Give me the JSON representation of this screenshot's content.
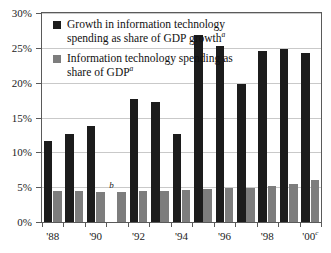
{
  "chart_data": {
    "type": "bar",
    "title": "",
    "xlabel": "",
    "ylabel": "",
    "ylim": [
      0,
      30
    ],
    "ytick_values": [
      0,
      5,
      10,
      15,
      20,
      25,
      30
    ],
    "ytick_labels": [
      "0%",
      "5%",
      "10%",
      "15%",
      "20%",
      "25%",
      "30%"
    ],
    "grid": true,
    "legend_position": "upper-left-inside",
    "categories": [
      "1988",
      "1989",
      "1990",
      "1991",
      "1992",
      "1993",
      "1994",
      "1995",
      "1996",
      "1997",
      "1998",
      "1999",
      "2000"
    ],
    "xtick_labels": [
      "'88",
      "'90",
      "'92",
      "'94",
      "'96",
      "'98",
      "'00"
    ],
    "xtick_superscripts": [
      "",
      "",
      "",
      "",
      "",
      "",
      "c"
    ],
    "series": [
      {
        "name": "Growth in information technology spending as share of GDP growth",
        "name_superscript": "a",
        "color": "#1c1c1c",
        "values": [
          11.7,
          12.7,
          13.8,
          null,
          17.7,
          17.2,
          12.6,
          26.9,
          25.2,
          19.8,
          24.5,
          24.8,
          24.2
        ]
      },
      {
        "name": "Information technology spending as share of GDP",
        "name_superscript": "a",
        "color": "#7d7d7d",
        "values": [
          4.4,
          4.5,
          4.3,
          4.3,
          4.4,
          4.5,
          4.6,
          4.7,
          4.9,
          4.95,
          5.2,
          5.5,
          6.1
        ]
      }
    ],
    "annotations": [
      {
        "text": "b",
        "category": "1991",
        "series": "Growth in information technology spending as share of GDP growth",
        "note": "missing-value footnote marker"
      }
    ]
  },
  "legend": {
    "items": [
      {
        "label": "Growth in information technology spending as share of GDP growth",
        "superscript": "a",
        "swatch": "dark-swatch-icon"
      },
      {
        "label": "Information technology spending as share of GDP",
        "superscript": "a",
        "swatch": "gray-swatch-icon"
      }
    ]
  },
  "colors": {
    "series_dark": "#1c1c1c",
    "series_light": "#7d7d7d",
    "grid": "#c9c9c9",
    "axis": "#5a5a5a",
    "background": "#ffffff",
    "text": "#1b1b1b"
  }
}
